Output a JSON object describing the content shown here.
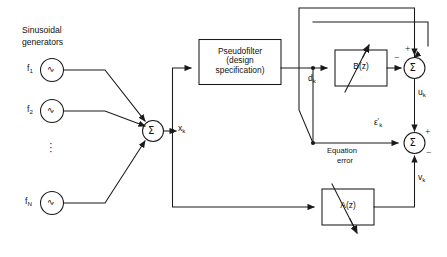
{
  "diagram": {
    "stroke_color": "#1a1a1a",
    "background_color": "#ffffff"
  },
  "labels": {
    "source_title_line1": "Sinusoidal",
    "source_title_line2": "generators",
    "equation_error_line1": "Equation",
    "equation_error_line2": "error",
    "vertical_ellipsis": "⋮"
  },
  "generators": [
    {
      "name": "generator-f1",
      "label": "f",
      "subscript": "1",
      "glyph": "∿"
    },
    {
      "name": "generator-f2",
      "label": "f",
      "subscript": "2",
      "glyph": "∿"
    },
    {
      "name": "generator-fN",
      "label": "f",
      "subscript": "N",
      "glyph": "∿"
    }
  ],
  "blocks": [
    {
      "name": "pseudofilter-block",
      "lines": [
        "Pseudofilter",
        "(design",
        "specification)"
      ]
    },
    {
      "name": "b-filter-block",
      "lines": [
        "B(z)"
      ]
    },
    {
      "name": "a-filter-block",
      "lines": [
        "A(z)"
      ]
    }
  ],
  "summers": [
    {
      "name": "input-summer",
      "glyph": "Σ"
    },
    {
      "name": "upper-summer",
      "glyph": "Σ",
      "sign_top": "+",
      "sign_left": "−"
    },
    {
      "name": "lower-summer",
      "glyph": "Σ",
      "sign_top": "+",
      "sign_right": "−"
    }
  ],
  "signals": [
    {
      "name": "signal-xk",
      "base": "x",
      "sub": "k",
      "prime": ""
    },
    {
      "name": "signal-dk",
      "base": "d",
      "sub": "k",
      "prime": ""
    },
    {
      "name": "signal-uk",
      "base": "u",
      "sub": "k",
      "prime": ""
    },
    {
      "name": "signal-epsilon-k",
      "base": "ε",
      "sub": "k",
      "prime": "′"
    },
    {
      "name": "signal-vk",
      "base": "v",
      "sub": "k",
      "prime": ""
    }
  ]
}
